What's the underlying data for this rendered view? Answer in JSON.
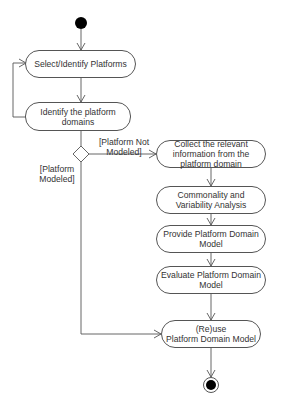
{
  "diagram": {
    "type": "uml-activity-diagram",
    "start_node": "initial",
    "end_node": "final",
    "actions": [
      {
        "id": "select",
        "label": "Select/Identify Platforms"
      },
      {
        "id": "identify",
        "label": "Identify the platform domains"
      },
      {
        "id": "collect",
        "label": "Collect the relevant information from the platform domain"
      },
      {
        "id": "cva",
        "label": "Commonality and Variability Analysis"
      },
      {
        "id": "provide",
        "label": "Provide Platform Domain Model"
      },
      {
        "id": "evaluate",
        "label": "Evaluate Platform Domain Model"
      },
      {
        "id": "reuse",
        "label_line1": "(Re)use",
        "label_line2": "Platform Domain Model"
      }
    ],
    "decision": {
      "guards": {
        "not_modeled_line1": "[Platform Not",
        "not_modeled_line2": "Modeled]",
        "modeled_line1": "[Platform",
        "modeled_line2": "Modeled]"
      }
    },
    "edges": [
      {
        "from": "initial",
        "to": "select"
      },
      {
        "from": "select",
        "to": "identify"
      },
      {
        "from": "identify",
        "to": "select",
        "note": "loop back"
      },
      {
        "from": "identify",
        "to": "decision"
      },
      {
        "from": "decision",
        "to": "collect",
        "guard": "[Platform Not Modeled]"
      },
      {
        "from": "decision",
        "to": "reuse",
        "guard": "[Platform Modeled]"
      },
      {
        "from": "collect",
        "to": "cva"
      },
      {
        "from": "cva",
        "to": "provide"
      },
      {
        "from": "provide",
        "to": "evaluate"
      },
      {
        "from": "evaluate",
        "to": "reuse"
      },
      {
        "from": "reuse",
        "to": "final"
      }
    ],
    "colors": {
      "stroke": "#555555",
      "fill": "#ffffff",
      "node_fill": "#000000",
      "text": "#333333"
    }
  }
}
